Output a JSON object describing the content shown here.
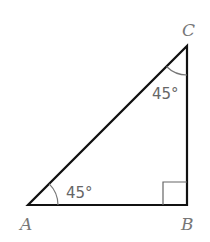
{
  "diagram": {
    "type": "right-triangle",
    "vertices": {
      "A": {
        "label": "A",
        "x": 28,
        "y": 205
      },
      "B": {
        "label": "B",
        "x": 187,
        "y": 205
      },
      "C": {
        "label": "C",
        "x": 187,
        "y": 46
      }
    },
    "angles": {
      "A": {
        "label": "45°"
      },
      "C": {
        "label": "45°"
      },
      "B": {
        "label": "right-angle"
      }
    },
    "colors": {
      "stroke": "#111111",
      "arc": "#777777",
      "text": "#777777"
    }
  }
}
